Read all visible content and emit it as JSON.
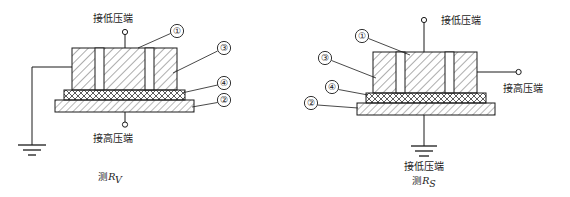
{
  "figure": {
    "background_color": "#ffffff",
    "line_color": "#1b1b1b",
    "hatch_color": "#4a4a4a",
    "diagrams": [
      {
        "id": "left",
        "caption_prefix": "测",
        "caption_symbol": "R",
        "caption_subscript": "V",
        "top_terminal_label": "接低压端",
        "bottom_terminal_label": "接高压端",
        "side_terminal_label": "",
        "ground_label": "",
        "callouts": [
          {
            "key": "1",
            "glyph": "①"
          },
          {
            "key": "3",
            "glyph": "③"
          },
          {
            "key": "4",
            "glyph": "④"
          },
          {
            "key": "2",
            "glyph": "②"
          }
        ]
      },
      {
        "id": "right",
        "caption_prefix": "测",
        "caption_symbol": "R",
        "caption_subscript": "S",
        "top_terminal_label": "接低压端",
        "bottom_terminal_label": "",
        "side_terminal_label": "接高压端",
        "ground_label": "接低压端",
        "callouts": [
          {
            "key": "1",
            "glyph": "①"
          },
          {
            "key": "3",
            "glyph": "③"
          },
          {
            "key": "4",
            "glyph": "④"
          },
          {
            "key": "2",
            "glyph": "②"
          }
        ]
      }
    ]
  }
}
